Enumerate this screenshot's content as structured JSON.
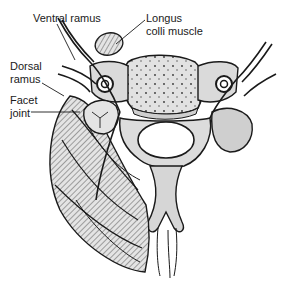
{
  "diagram": {
    "type": "anatomical-illustration",
    "labels": {
      "ventral_ramus": "Ventral ramus",
      "longus_colli": "Longus\ncolli muscle",
      "dorsal_ramus": "Dorsal\nramus",
      "facet_joint": "Facet\njoint"
    },
    "colors": {
      "ink": "#1a1a1a",
      "bone_fill": "#d9d9d9",
      "muscle_fill": "#c8c8c8",
      "background": "#ffffff"
    }
  }
}
